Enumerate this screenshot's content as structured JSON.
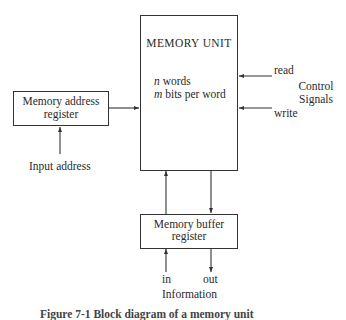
{
  "figure": {
    "memory_unit": {
      "title": "MEMORY UNIT",
      "line1_var": "n",
      "line1_text": " words",
      "line2_var": "m",
      "line2_text": " bits per word"
    },
    "memory_address_register": {
      "line1": "Memory address",
      "line2": "register"
    },
    "input_address_label": "Input address",
    "control": {
      "read_label": "read",
      "write_label": "write",
      "group_line1": "Control",
      "group_line2": "Signals"
    },
    "memory_buffer_register": {
      "line1": "Memory buffer",
      "line2": "register"
    },
    "in_label": "in",
    "out_label": "out",
    "information_label": "Information",
    "caption": "Figure 7-1   Block diagram of a memory unit"
  },
  "colors": {
    "line": "#333333",
    "text": "#2a2a2a",
    "background": "#ffffff"
  }
}
